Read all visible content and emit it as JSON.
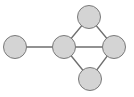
{
  "diagram": {
    "type": "graph",
    "colors": {
      "node_fill": "#d4d4d4",
      "node_stroke": "#7a7a7a",
      "edge": "#6e6e6e",
      "background": "#ffffff"
    },
    "nodes": [
      {
        "id": "left",
        "cx": 15,
        "cy": 47,
        "r": 11.5
      },
      {
        "id": "center",
        "cx": 64,
        "cy": 47,
        "r": 11.5
      },
      {
        "id": "top",
        "cx": 89,
        "cy": 17,
        "r": 11.5
      },
      {
        "id": "right",
        "cx": 114,
        "cy": 47,
        "r": 11.5
      },
      {
        "id": "bottom",
        "cx": 90,
        "cy": 79,
        "r": 11.5
      }
    ],
    "edges": [
      {
        "from": "left",
        "to": "center"
      },
      {
        "from": "center",
        "to": "top"
      },
      {
        "from": "center",
        "to": "right"
      },
      {
        "from": "center",
        "to": "bottom"
      },
      {
        "from": "top",
        "to": "right"
      },
      {
        "from": "right",
        "to": "bottom"
      }
    ]
  }
}
